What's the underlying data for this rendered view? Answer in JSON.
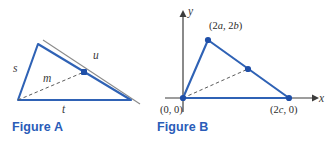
{
  "colors": {
    "blue_stroke": "#2f62b5",
    "blue_caption": "#2a5cb8",
    "blue_dot": "#1f4fa8",
    "gray_line": "#8a8a8a",
    "axis": "#3c3c3c",
    "dash": "#5a5a5a",
    "label_text": "#3a3a3a"
  },
  "figure_a": {
    "caption": "Figure A",
    "labels": {
      "side_s": "s",
      "side_t": "t",
      "segment_u": "u",
      "median_m": "m"
    },
    "geometry": {
      "vertex_top": [
        38,
        44
      ],
      "vertex_bottom_left": [
        18,
        100
      ],
      "vertex_bottom_right": [
        131,
        100
      ],
      "midpoint": [
        84,
        72
      ],
      "gray_line_start": [
        43,
        40
      ],
      "gray_line_end": [
        140,
        104
      ]
    }
  },
  "figure_b": {
    "caption": "Figure B",
    "axis_labels": {
      "x": "x",
      "y": "y"
    },
    "points": [
      {
        "name": "origin",
        "label": "(0, 0)",
        "coords": [
          28,
          98
        ]
      },
      {
        "name": "apex",
        "label": "(2a, 2b)",
        "coords": [
          53,
          40
        ]
      },
      {
        "name": "base-right",
        "label": "(2c, 0)",
        "coords": [
          134,
          98
        ]
      },
      {
        "name": "midpoint",
        "label": "",
        "coords": [
          93,
          69
        ]
      }
    ],
    "point_label_text": {
      "origin": {
        "prefix": "(0, 0)"
      },
      "apex": {
        "open": "(2",
        "var1": "a",
        "mid": ", 2",
        "var2": "b",
        "close": ")"
      },
      "base_right": {
        "open": "(2",
        "var1": "c",
        "close": ", 0)"
      }
    },
    "axes": {
      "y_axis_top": [
        28,
        14
      ],
      "y_axis_bottom": [
        28,
        112
      ],
      "x_axis_left": [
        10,
        98
      ],
      "x_axis_right": [
        160,
        98
      ]
    }
  }
}
